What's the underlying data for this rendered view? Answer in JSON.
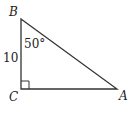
{
  "diagram": {
    "type": "right-triangle",
    "vertices": {
      "B": {
        "label": "B",
        "x": 21,
        "y": 19
      },
      "C": {
        "label": "C",
        "x": 21,
        "y": 89
      },
      "A": {
        "label": "A",
        "x": 117,
        "y": 89
      }
    },
    "side_BC_label": "10",
    "angle_B_label": "50°",
    "right_angle_at": "C",
    "stroke_color": "#333333"
  }
}
